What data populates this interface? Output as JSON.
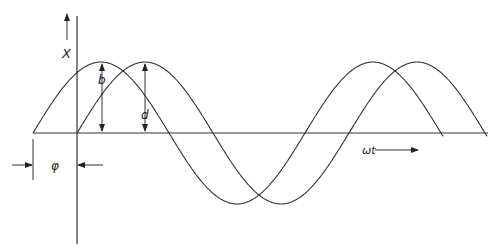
{
  "labels": {
    "y_axis": "X",
    "amplitude_b": "b",
    "amplitude_d": "d",
    "phase": "φ",
    "x_axis": "ωt"
  },
  "diagram": {
    "type": "phase-shifted sinusoids",
    "curves": [
      {
        "name": "leading-wave",
        "phase_offset_deg": 90,
        "amplitude": 1
      },
      {
        "name": "reference-wave",
        "phase_offset_deg": 0,
        "amplitude": 1
      }
    ],
    "line_color": "#333333"
  }
}
